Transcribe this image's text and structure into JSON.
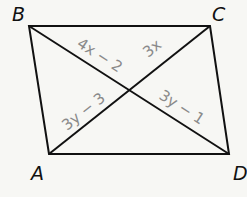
{
  "figure": {
    "type": "parallelogram with diagonals",
    "colors": {
      "background": "#f7f7f4",
      "line": "#111111",
      "vertex_label": "#111111",
      "expression_label": "#8a8a8a"
    },
    "vertices": [
      {
        "name": "B",
        "x": 29,
        "y": 26
      },
      {
        "name": "C",
        "x": 210,
        "y": 26
      },
      {
        "name": "A",
        "x": 49,
        "y": 154
      },
      {
        "name": "D",
        "x": 229,
        "y": 154
      }
    ],
    "vertex_labels": {
      "B": "B",
      "C": "C",
      "A": "A",
      "D": "D"
    },
    "diagonals": [
      {
        "from": "B",
        "to": "D"
      },
      {
        "from": "A",
        "to": "C"
      }
    ],
    "segment_labels": {
      "B_to_center": "4x − 2",
      "C_to_center": "3x",
      "A_to_center": "3y − 3",
      "D_to_center": "3y − 1"
    }
  }
}
